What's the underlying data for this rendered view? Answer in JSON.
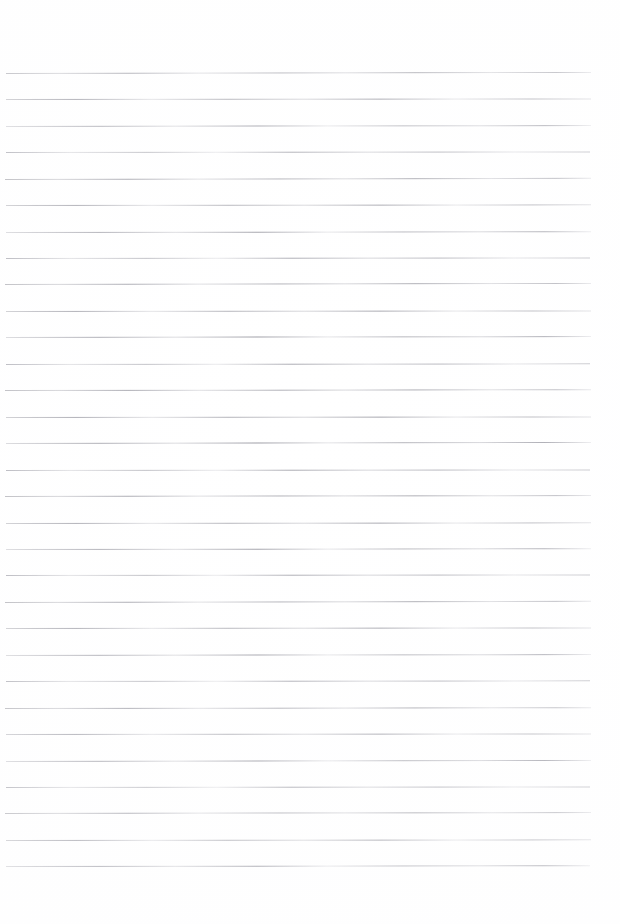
{
  "document": {
    "kind": "scanned-lined-paper",
    "title": "Blank ruled notebook page",
    "page_width": 620,
    "page_height": 924,
    "background_color": "#ffffff",
    "rule_color": "#9a9aa2",
    "has_text": false,
    "has_margin_rule": false,
    "text_content": ""
  },
  "ruling": {
    "line_count": 31,
    "first_line_y": 72.8,
    "line_spacing": 26.45,
    "line_thickness": 1,
    "left_margin": 6,
    "right_margin": 29,
    "bottom_margin": 58,
    "skew_degrees": -0.08
  },
  "lines": [
    {
      "index": 1,
      "y": 72.8,
      "x": 6,
      "width": 585,
      "ink": "v0",
      "skew": -0.1,
      "opacity": 0.92
    },
    {
      "index": 2,
      "y": 99.3,
      "x": 6,
      "width": 585,
      "ink": "v1",
      "skew": -0.06,
      "opacity": 0.95
    },
    {
      "index": 3,
      "y": 125.7,
      "x": 6,
      "width": 585,
      "ink": "v2",
      "skew": -0.09,
      "opacity": 0.9
    },
    {
      "index": 4,
      "y": 152.2,
      "x": 6,
      "width": 584,
      "ink": "v3",
      "skew": -0.05,
      "opacity": 0.88
    },
    {
      "index": 5,
      "y": 178.6,
      "x": 5,
      "width": 586,
      "ink": "v0",
      "skew": -0.11,
      "opacity": 0.96
    },
    {
      "index": 6,
      "y": 205.1,
      "x": 6,
      "width": 585,
      "ink": "v1",
      "skew": -0.07,
      "opacity": 0.91
    },
    {
      "index": 7,
      "y": 231.5,
      "x": 6,
      "width": 585,
      "ink": "v2",
      "skew": -0.08,
      "opacity": 0.93
    },
    {
      "index": 8,
      "y": 258.0,
      "x": 6,
      "width": 584,
      "ink": "v3",
      "skew": -0.06,
      "opacity": 0.89
    },
    {
      "index": 9,
      "y": 284.4,
      "x": 5,
      "width": 586,
      "ink": "v0",
      "skew": -0.1,
      "opacity": 0.94
    },
    {
      "index": 10,
      "y": 310.9,
      "x": 6,
      "width": 585,
      "ink": "v1",
      "skew": -0.05,
      "opacity": 0.9
    },
    {
      "index": 11,
      "y": 337.3,
      "x": 6,
      "width": 585,
      "ink": "v2",
      "skew": -0.09,
      "opacity": 0.95
    },
    {
      "index": 12,
      "y": 363.8,
      "x": 6,
      "width": 584,
      "ink": "v3",
      "skew": -0.07,
      "opacity": 0.87
    },
    {
      "index": 13,
      "y": 390.2,
      "x": 5,
      "width": 586,
      "ink": "v0",
      "skew": -0.08,
      "opacity": 0.93
    },
    {
      "index": 14,
      "y": 416.7,
      "x": 6,
      "width": 585,
      "ink": "v1",
      "skew": -0.06,
      "opacity": 0.91
    },
    {
      "index": 15,
      "y": 443.1,
      "x": 6,
      "width": 585,
      "ink": "v2",
      "skew": -0.1,
      "opacity": 0.96
    },
    {
      "index": 16,
      "y": 469.6,
      "x": 6,
      "width": 584,
      "ink": "v3",
      "skew": -0.05,
      "opacity": 0.88
    },
    {
      "index": 17,
      "y": 496.0,
      "x": 5,
      "width": 586,
      "ink": "v0",
      "skew": -0.09,
      "opacity": 0.94
    },
    {
      "index": 18,
      "y": 522.5,
      "x": 6,
      "width": 585,
      "ink": "v1",
      "skew": -0.07,
      "opacity": 0.9
    },
    {
      "index": 19,
      "y": 548.9,
      "x": 6,
      "width": 585,
      "ink": "v2",
      "skew": -0.08,
      "opacity": 0.92
    },
    {
      "index": 20,
      "y": 575.4,
      "x": 6,
      "width": 584,
      "ink": "v3",
      "skew": -0.06,
      "opacity": 0.89
    },
    {
      "index": 21,
      "y": 601.8,
      "x": 5,
      "width": 586,
      "ink": "v0",
      "skew": -0.11,
      "opacity": 0.95
    },
    {
      "index": 22,
      "y": 628.3,
      "x": 6,
      "width": 585,
      "ink": "v1",
      "skew": -0.05,
      "opacity": 0.91
    },
    {
      "index": 23,
      "y": 654.7,
      "x": 6,
      "width": 585,
      "ink": "v2",
      "skew": -0.09,
      "opacity": 0.93
    },
    {
      "index": 24,
      "y": 681.2,
      "x": 6,
      "width": 584,
      "ink": "v3",
      "skew": -0.07,
      "opacity": 0.88
    },
    {
      "index": 25,
      "y": 707.6,
      "x": 5,
      "width": 586,
      "ink": "v0",
      "skew": -0.08,
      "opacity": 0.94
    },
    {
      "index": 26,
      "y": 734.1,
      "x": 6,
      "width": 585,
      "ink": "v1",
      "skew": -0.06,
      "opacity": 0.9
    },
    {
      "index": 27,
      "y": 760.5,
      "x": 6,
      "width": 585,
      "ink": "v2",
      "skew": -0.1,
      "opacity": 0.96
    },
    {
      "index": 28,
      "y": 787.0,
      "x": 6,
      "width": 584,
      "ink": "v3",
      "skew": -0.05,
      "opacity": 0.87
    },
    {
      "index": 29,
      "y": 813.4,
      "x": 5,
      "width": 586,
      "ink": "v0",
      "skew": -0.09,
      "opacity": 0.93
    },
    {
      "index": 30,
      "y": 839.9,
      "x": 6,
      "width": 585,
      "ink": "v1",
      "skew": -0.07,
      "opacity": 0.91
    },
    {
      "index": 31,
      "y": 866.3,
      "x": 6,
      "width": 584,
      "ink": "v2",
      "skew": -0.08,
      "opacity": 0.95
    }
  ]
}
